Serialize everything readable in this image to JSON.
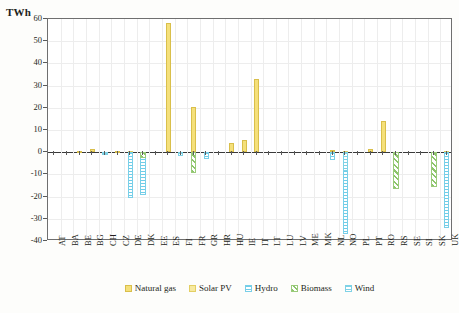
{
  "chart_data": {
    "type": "bar",
    "title": "",
    "subtitle": "",
    "xlabel": "",
    "ylabel": "TWh",
    "ylim": [
      -40,
      60
    ],
    "ytick_values": [
      60,
      50,
      40,
      30,
      20,
      10,
      0,
      -10,
      -20,
      -30,
      -40
    ],
    "ytick_labels": [
      "60",
      "50",
      "40",
      "30",
      "20",
      "10",
      "0",
      "-10",
      "-20",
      "-30",
      "-40"
    ],
    "grid": true,
    "legend_position": "bottom",
    "categories": [
      "AT",
      "BA",
      "BE",
      "BG",
      "CH",
      "CZ",
      "DE",
      "DK",
      "EE",
      "ES",
      "FI",
      "FR",
      "GR",
      "HR",
      "HU",
      "IE",
      "IT",
      "LT",
      "LU",
      "LV",
      "ME",
      "MK",
      "NL",
      "NO",
      "PL",
      "PT",
      "RO",
      "RS",
      "SE",
      "SI",
      "SK",
      "UK"
    ],
    "series": [
      {
        "name": "Natural gas",
        "color": "#f5e07a",
        "values": [
          0,
          0,
          0.4,
          1.3,
          0,
          0.6,
          0,
          0,
          0,
          58,
          0,
          20.5,
          0,
          0,
          4.3,
          5.7,
          32.8,
          0,
          0,
          0,
          0,
          0,
          1.2,
          0,
          0,
          1.4,
          14.2,
          0,
          0,
          0,
          0,
          0
        ]
      },
      {
        "name": "Solar PV",
        "color": "#f7e9a0",
        "values": [
          0,
          0,
          0,
          0,
          0,
          0,
          0.5,
          0,
          0,
          0,
          0,
          0,
          0,
          0,
          0,
          0,
          0,
          0,
          0,
          0,
          0,
          0,
          0,
          0.5,
          0,
          0,
          0,
          0,
          0,
          0,
          0,
          0.6
        ]
      },
      {
        "name": "Hydro",
        "color": "#6fcde8",
        "values": [
          0,
          0,
          0,
          0,
          0,
          0,
          -20.5,
          -19.5,
          0,
          0,
          0,
          0,
          -3.2,
          0,
          0,
          0,
          0,
          0,
          0,
          0,
          0,
          0,
          -3.5,
          -37,
          0,
          0,
          0,
          0,
          0,
          0,
          0,
          -34
        ]
      },
      {
        "name": "Biomass",
        "color": "#8dc46c",
        "values": [
          0,
          0,
          0,
          0,
          0,
          0,
          0,
          -2.5,
          0,
          0,
          0,
          -9.5,
          0,
          0,
          0,
          0,
          0,
          0,
          0,
          0,
          0,
          0,
          0,
          0,
          0,
          0,
          0,
          -16.5,
          0,
          0,
          -15.5,
          0
        ]
      },
      {
        "name": "Wind",
        "color": "#7fd2e6",
        "values": [
          0,
          0,
          0,
          0,
          -1.1,
          0,
          0,
          0,
          0,
          0,
          -1.5,
          0,
          0,
          0,
          0,
          0,
          0,
          0,
          0,
          0,
          0,
          0,
          0,
          -8.5,
          0,
          0,
          0,
          0,
          0,
          0,
          0,
          0
        ]
      }
    ]
  },
  "legend": {
    "items": [
      {
        "label": "Natural gas",
        "key": "natural-gas"
      },
      {
        "label": "Solar PV",
        "key": "solar-pv"
      },
      {
        "label": "Hydro",
        "key": "hydro"
      },
      {
        "label": "Biomass",
        "key": "biomass"
      },
      {
        "label": "Wind",
        "key": "wind"
      }
    ]
  }
}
